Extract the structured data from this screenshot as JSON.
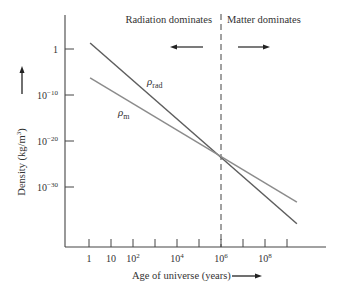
{
  "chart_data": {
    "type": "line",
    "title": "",
    "xlabel": "Age of universe (years)",
    "ylabel": "Density (kg/m³)",
    "x_scale": "log",
    "y_scale": "log",
    "x_ticks_log10": [
      0,
      1,
      2,
      3,
      4,
      5,
      6,
      7,
      8,
      9
    ],
    "x_tick_labels": [
      {
        "log10": 0,
        "base": "1",
        "exp": ""
      },
      {
        "log10": 1,
        "base": "10",
        "exp": ""
      },
      {
        "log10": 2,
        "base": "10",
        "exp": "2"
      },
      {
        "log10": 4,
        "base": "10",
        "exp": "4"
      },
      {
        "log10": 6,
        "base": "10",
        "exp": "6"
      },
      {
        "log10": 8,
        "base": "10",
        "exp": "8"
      }
    ],
    "y_tick_labels": [
      {
        "log10": 0,
        "base": "1",
        "exp": ""
      },
      {
        "log10": -10,
        "base": "10",
        "exp": "−10"
      },
      {
        "log10": -20,
        "base": "10",
        "exp": "−20"
      },
      {
        "log10": -30,
        "base": "10",
        "exp": "−30"
      }
    ],
    "xlim_log10": [
      -1.1,
      10.8
    ],
    "ylim_log10": [
      -42.5,
      7.2
    ],
    "series": [
      {
        "name": "ρ_rad",
        "label_base": "ρ",
        "label_sub": "rad",
        "color": "#5e5e5e",
        "points_log10": [
          [
            0.05,
            1.3
          ],
          [
            9.45,
            -38.0
          ]
        ]
      },
      {
        "name": "ρ_m",
        "label_base": "ρ",
        "label_sub": "m",
        "color": "#8c8c8c",
        "points_log10": [
          [
            0.05,
            -6.3
          ],
          [
            9.45,
            -33.3
          ]
        ]
      }
    ],
    "crossover": {
      "x_log10": 6,
      "y_log10": -23
    },
    "annotations": [
      {
        "text": "Radiation dominates",
        "arrow": "left"
      },
      {
        "text": "Matter dominates",
        "arrow": "right"
      }
    ],
    "vertical_marker_log10": 6,
    "grid": false,
    "legend": "inline labels"
  }
}
